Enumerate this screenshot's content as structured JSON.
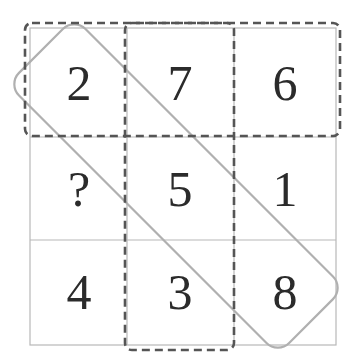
{
  "puzzle": {
    "grid": [
      [
        "2",
        "7",
        "6"
      ],
      [
        "?",
        "5",
        "1"
      ],
      [
        "4",
        "3",
        "8"
      ]
    ],
    "highlights": {
      "top_row": "dashed",
      "middle_column": "dashed",
      "main_diagonal": "solid-grey"
    },
    "colors": {
      "grid_line": "#b8b8b8",
      "dashed": "#555555",
      "diagonal": "#b0b0b0",
      "digits": "#2b2b2b"
    }
  }
}
